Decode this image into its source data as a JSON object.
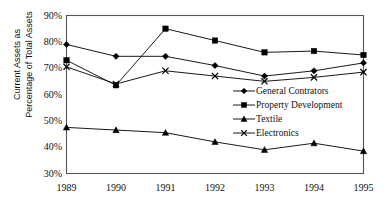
{
  "chart_data": {
    "type": "line",
    "title": "",
    "xlabel": "",
    "ylabel": "Current Assets as Percentage of Total Assets",
    "ylabel_lines": [
      "Current Assets as",
      "Percentage of Total Assets"
    ],
    "categories": [
      "1989",
      "1990",
      "1991",
      "1992",
      "1993",
      "1994",
      "1995"
    ],
    "ylim": [
      30,
      90
    ],
    "yticks": [
      90,
      80,
      70,
      60,
      50,
      40,
      30
    ],
    "ytick_labels": [
      "90%",
      "80%",
      "70%",
      "60%",
      "50%",
      "40%",
      "30%"
    ],
    "grid": false,
    "legend_position": "inside-right",
    "series": [
      {
        "name": "General Contrators",
        "marker": "diamond",
        "values": [
          79.0,
          74.5,
          74.5,
          71.0,
          67.0,
          69.0,
          72.0
        ]
      },
      {
        "name": "Property Development",
        "marker": "square",
        "values": [
          73.0,
          63.5,
          85.0,
          80.5,
          76.0,
          76.5,
          75.0
        ]
      },
      {
        "name": "Textile",
        "marker": "triangle",
        "values": [
          47.5,
          46.5,
          45.5,
          42.0,
          39.0,
          41.5,
          38.5
        ]
      },
      {
        "name": "Electronics",
        "marker": "cross",
        "values": [
          70.5,
          64.0,
          69.0,
          67.0,
          65.0,
          66.5,
          68.5
        ]
      }
    ]
  },
  "legend": {
    "items": [
      {
        "label": "General Contrators",
        "marker": "diamond"
      },
      {
        "label": "Property Development",
        "marker": "square"
      },
      {
        "label": "Textile",
        "marker": "triangle"
      },
      {
        "label": "Electronics",
        "marker": "cross"
      }
    ]
  },
  "colors": {
    "line": "#1a1a1a",
    "marker": "#000000",
    "axis": "#555555",
    "background": "#ffffff",
    "text": "#111111"
  }
}
